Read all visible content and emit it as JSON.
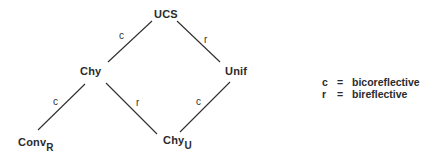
{
  "diagram": {
    "nodes": [
      {
        "id": "ucs",
        "label": "UCS",
        "sub": ""
      },
      {
        "id": "chy",
        "label": "Chy",
        "sub": ""
      },
      {
        "id": "unif",
        "label": "Unif",
        "sub": ""
      },
      {
        "id": "conv",
        "label": "Conv",
        "sub": "R"
      },
      {
        "id": "chyu",
        "label": "Chy",
        "sub": "U"
      }
    ],
    "edges": [
      {
        "from": "ucs",
        "to": "chy",
        "label": "c"
      },
      {
        "from": "ucs",
        "to": "unif",
        "label": "r"
      },
      {
        "from": "chy",
        "to": "conv",
        "label": "c"
      },
      {
        "from": "chy",
        "to": "chyu",
        "label": "r"
      },
      {
        "from": "unif",
        "to": "chyu",
        "label": "c"
      }
    ],
    "legend": [
      {
        "symbol": "c",
        "eq": "=",
        "meaning": "bicoreflective"
      },
      {
        "symbol": "r",
        "eq": "=",
        "meaning": "bireflective"
      }
    ],
    "line_color": "#2e2e2e"
  }
}
